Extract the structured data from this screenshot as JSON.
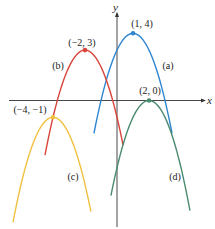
{
  "chart_data": {
    "type": "line",
    "title": "",
    "xlabel": "x",
    "ylabel": "y",
    "grid": false,
    "legend": "none (curves labeled inline)",
    "series": [
      {
        "name": "(a)",
        "equation": "y = -(x - 1)^2 + 4",
        "a": -1,
        "h": 1,
        "k": 4,
        "vertex": [
          1,
          4
        ],
        "vertex_label": "(1, 4)",
        "x_range": [
          -1.44,
          3.44
        ],
        "color": "#2f86d0"
      },
      {
        "name": "(b)",
        "equation": "y = -(x + 2)^2 + 3",
        "a": -1,
        "h": -2,
        "k": 3,
        "vertex": [
          -2,
          3
        ],
        "vertex_label": "(−2, 3)",
        "x_range": [
          -4.5,
          0.38
        ],
        "color": "#d8443a"
      },
      {
        "name": "(c)",
        "equation": "y = -(x + 4)^2 - 1",
        "a": -1,
        "h": -4,
        "k": -1,
        "vertex": [
          -4,
          -1
        ],
        "vertex_label": "(−4, −1)",
        "x_range": [
          -6.5,
          -1.63
        ],
        "color": "#f0c040"
      },
      {
        "name": "(d)",
        "equation": "y = -(x - 2)^2",
        "a": -1,
        "h": 2,
        "k": 0,
        "vertex": [
          2,
          0
        ],
        "vertex_label": "(2, 0)",
        "x_range": [
          -0.38,
          4.56
        ],
        "color": "#4a8a6e"
      }
    ],
    "xlim": [
      -6.8,
      5.5
    ],
    "ylim": [
      -7.5,
      5.2
    ]
  },
  "axes": {
    "x_label": "x",
    "y_label": "y",
    "color": "#333333"
  },
  "labels": {
    "a": {
      "text": "(a)",
      "pos": [
        168,
        69
      ]
    },
    "b": {
      "text": "(b)",
      "pos": [
        58,
        69
      ]
    },
    "c": {
      "text": "(c)",
      "pos": [
        73,
        180
      ]
    },
    "d": {
      "text": "(d)",
      "pos": [
        175,
        180
      ]
    },
    "va": {
      "text": "(1, 4)",
      "pos": [
        142,
        27
      ]
    },
    "vb": {
      "text": "(−2, 3)",
      "pos": [
        82,
        46
      ]
    },
    "vc": {
      "text": "(−4, −1)",
      "pos": [
        30,
        113
      ]
    },
    "vd": {
      "text": "(2, 0)",
      "pos": [
        150,
        94
      ]
    }
  }
}
